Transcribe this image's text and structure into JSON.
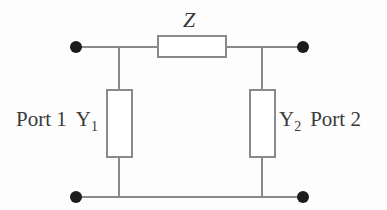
{
  "diagram": {
    "background_color": "#fdfdfd",
    "wire_color": "#8a8a8a",
    "node_color": "#1c1c1c",
    "text_color": "#3a3a3a",
    "series_element": {
      "label": "Z",
      "name": "series-impedance-z"
    },
    "shunt_left": {
      "symbol": "Y",
      "subscript": "1",
      "name": "shunt-admittance-y1"
    },
    "shunt_right": {
      "symbol": "Y",
      "subscript": "2",
      "name": "shunt-admittance-y2"
    },
    "port_left": {
      "label": "Port 1"
    },
    "port_right": {
      "label": "Port 2"
    },
    "terminals": [
      {
        "name": "port1-positive-terminal",
        "x": 76,
        "y": 47
      },
      {
        "name": "port1-negative-terminal",
        "x": 76,
        "y": 197
      },
      {
        "name": "port2-positive-terminal",
        "x": 303,
        "y": 47
      },
      {
        "name": "port2-negative-terminal",
        "x": 303,
        "y": 197
      }
    ]
  }
}
